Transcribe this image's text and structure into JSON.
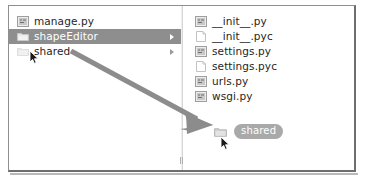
{
  "window": {
    "title": "File browser drag-and-drop"
  },
  "left_pane": {
    "name": "project tree",
    "items": [
      {
        "label": "manage.py",
        "icon": "python-file-icon",
        "selected": false,
        "expander": false,
        "ghost": false
      },
      {
        "label": "shapeEditor",
        "icon": "folder-icon",
        "selected": true,
        "expander": true,
        "ghost": false
      },
      {
        "label": "shared",
        "icon": "folder-icon",
        "selected": false,
        "expander": true,
        "ghost": true
      }
    ]
  },
  "right_pane": {
    "name": "folder contents",
    "items": [
      {
        "label": "__init__.py",
        "icon": "python-file-icon"
      },
      {
        "label": "__init__.pyc",
        "icon": "blank-file-icon"
      },
      {
        "label": "settings.py",
        "icon": "python-file-icon"
      },
      {
        "label": "settings.pyc",
        "icon": "blank-file-icon"
      },
      {
        "label": "urls.py",
        "icon": "python-file-icon"
      },
      {
        "label": "wsgi.py",
        "icon": "python-file-icon"
      }
    ]
  },
  "drag": {
    "ghost_label": "shared",
    "ghost_icon": "folder-icon",
    "arrow_icon": "drag-direction-arrow",
    "arrow_from": "70,50",
    "arrow_to": "210,124",
    "cursor_icon": "mouse-pointer-icon"
  },
  "colors": {
    "selection": "#8e8e8e",
    "ghost_pill": "#a9a9a9",
    "arrow": "#8c8c8c",
    "frame_border": "#8f8f8f",
    "divider": "#d7d7d7",
    "text": "#262626"
  }
}
